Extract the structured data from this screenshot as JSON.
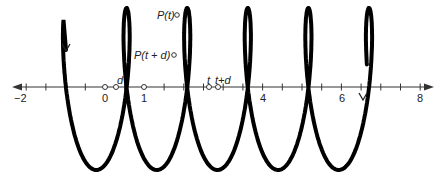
{
  "figure": {
    "axis": {
      "tick_labels": [
        "−2",
        "0",
        "1",
        "4",
        "6",
        "8"
      ],
      "tick_values": [
        -2,
        0,
        1,
        4,
        6,
        8
      ],
      "min": -2.5,
      "max": 8.3,
      "minor_ticks": [
        -1.5,
        -1,
        -0.5,
        0.5,
        1.5,
        2,
        2.5,
        3,
        3.5,
        4.5,
        5,
        5.5,
        6.5,
        7,
        7.5
      ]
    },
    "labels": {
      "p_t": "P(t)",
      "p_t_plus_d": "P(t + d)",
      "d": "d",
      "t": "t",
      "t_plus_d": "t+d"
    },
    "marked_points": {
      "axis_open_circles": [
        0,
        0.35,
        1,
        2.35,
        2.65
      ],
      "curve_points": [
        "P(t)",
        "P(t + d)"
      ]
    },
    "curve": {
      "description": "Looping curve (prolate trochoid) traced along the number line",
      "loops_count": 6,
      "start_arrow": "down",
      "end_arrow": "down",
      "stroke_color": "#000000"
    }
  }
}
